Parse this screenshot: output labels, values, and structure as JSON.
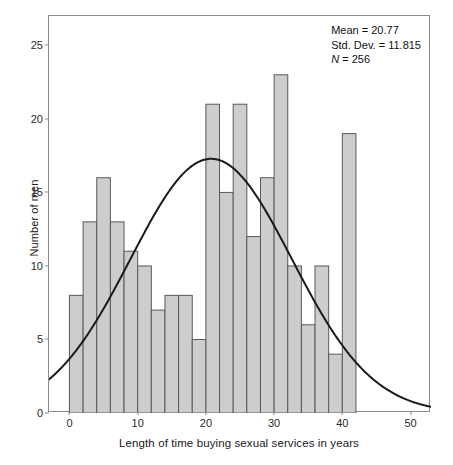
{
  "chart_data": {
    "type": "bar",
    "title": "",
    "subtitle": "",
    "xlabel": "Length of time buying sexual services in years",
    "ylabel": "Number of men",
    "xlim": [
      -3,
      53
    ],
    "ylim": [
      0,
      27
    ],
    "xticks": [
      0,
      10,
      20,
      30,
      40,
      50
    ],
    "yticks": [
      0,
      5,
      10,
      15,
      20,
      25
    ],
    "grid": false,
    "legend": "none",
    "bin_width": 2,
    "bin_starts": [
      0,
      2,
      4,
      6,
      8,
      10,
      12,
      14,
      16,
      18,
      20,
      22,
      24,
      26,
      28,
      30,
      32,
      34,
      36,
      38,
      40
    ],
    "categories": [
      "0-2",
      "2-4",
      "4-6",
      "6-8",
      "8-10",
      "10-12",
      "12-14",
      "14-16",
      "16-18",
      "18-20",
      "20-22",
      "22-24",
      "24-26",
      "26-28",
      "28-30",
      "30-32",
      "32-34",
      "34-36",
      "36-38",
      "38-40",
      "40-42"
    ],
    "values": [
      8,
      13,
      16,
      13,
      11,
      10,
      7,
      8,
      8,
      5,
      21,
      15,
      21,
      12,
      16,
      23,
      10,
      6,
      10,
      4,
      19
    ],
    "overlay": {
      "type": "normal-curve",
      "mean": 20.77,
      "std_dev": 11.815,
      "n": 256,
      "color": "#1a1a1a"
    },
    "bar_fill": "#cdcdcd",
    "bar_stroke": "#5a5a5a",
    "axis_color": "#888b8d"
  },
  "annotation": {
    "mean_label": "Mean = 20.77",
    "std_label": "Std. Dev. = 11.815",
    "n_prefix": "N",
    "n_label": " = 256"
  }
}
